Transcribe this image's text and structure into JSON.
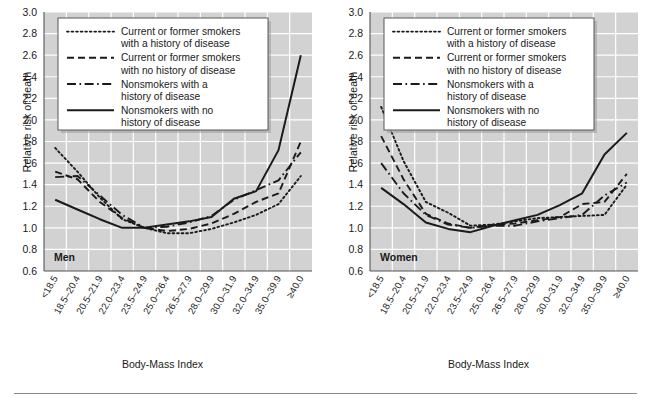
{
  "figure": {
    "bottom_rule": true,
    "background": "#ffffff",
    "plot_background": "#d2d2d2",
    "gridline_color": "#ffffff",
    "line_color": "#1a1a1a"
  },
  "panels": [
    {
      "id": "men",
      "group_label": "Men",
      "xlabel": "Body-Mass Index",
      "ylabel": "Relative risk of death"
    },
    {
      "id": "women",
      "group_label": "Women",
      "xlabel": "Body-Mass Index",
      "ylabel": "Relative risk of death"
    }
  ],
  "legend": {
    "entries": [
      {
        "style": "dotted",
        "line1": "Current or former smokers",
        "line2": "with a history of disease"
      },
      {
        "style": "dashed",
        "line1": "Current or former smokers",
        "line2": "with no history of disease"
      },
      {
        "style": "dashdot",
        "line1": "Nonsmokers with a",
        "line2": "history of disease"
      },
      {
        "style": "solid",
        "line1": "Nonsmokers with no",
        "line2": "history of disease"
      }
    ]
  },
  "chart_data": [
    {
      "type": "line",
      "title": "Men",
      "xlabel": "Body-Mass Index",
      "ylabel": "Relative risk of death",
      "ylim": [
        0.6,
        3.0
      ],
      "ytick_step": 0.2,
      "yticks": [
        "3.0",
        "2.8",
        "2.6",
        "2.4",
        "2.2",
        "2.0",
        "1.8",
        "1.6",
        "1.4",
        "1.2",
        "1.0",
        "0.8",
        "0.6"
      ],
      "grid": true,
      "legend_position": "upper-left-inside",
      "categories": [
        "<18.5",
        "18.5–20.4",
        "20.5–21.9",
        "22.0–23.4",
        "23.5–24.9",
        "25.0–26.4",
        "26.5–27.9",
        "28.0–29.9",
        "30.0–31.9",
        "32.0–34.9",
        "35.0–39.9",
        "≥40.0"
      ],
      "series": [
        {
          "name": "Current or former smokers with a history of disease",
          "style": "dotted",
          "values": [
            1.74,
            1.52,
            1.28,
            1.08,
            1.0,
            0.95,
            0.95,
            0.99,
            1.05,
            1.12,
            1.22,
            1.48
          ]
        },
        {
          "name": "Current or former smokers with no history of disease",
          "style": "dashed",
          "values": [
            1.52,
            1.45,
            1.24,
            1.09,
            1.0,
            0.97,
            0.99,
            1.04,
            1.13,
            1.24,
            1.32,
            1.8
          ]
        },
        {
          "name": "Nonsmokers with a history of disease",
          "style": "dashdot",
          "values": [
            1.47,
            1.48,
            1.3,
            1.12,
            1.0,
            1.01,
            1.05,
            1.11,
            1.26,
            1.35,
            1.44,
            1.7
          ]
        },
        {
          "name": "Nonsmokers with no history of disease",
          "style": "solid",
          "values": [
            1.26,
            1.17,
            1.08,
            1.0,
            1.0,
            1.03,
            1.06,
            1.1,
            1.27,
            1.34,
            1.72,
            2.6
          ]
        }
      ]
    },
    {
      "type": "line",
      "title": "Women",
      "xlabel": "Body-Mass Index",
      "ylabel": "Relative risk of death",
      "ylim": [
        0.6,
        3.0
      ],
      "ytick_step": 0.2,
      "yticks": [
        "3.0",
        "2.8",
        "2.6",
        "2.4",
        "2.2",
        "2.0",
        "1.8",
        "1.6",
        "1.4",
        "1.2",
        "1.0",
        "0.8",
        "0.6"
      ],
      "grid": true,
      "legend_position": "upper-left-inside",
      "categories": [
        "<18.5",
        "18.5–20.4",
        "20.5–21.9",
        "22.0–23.4",
        "23.5–24.9",
        "25.0–26.4",
        "26.5–27.9",
        "28.0–29.9",
        "30.0–31.9",
        "32.0–34.9",
        "35.0–39.9",
        "≥40.0"
      ],
      "series": [
        {
          "name": "Current or former smokers with a history of disease",
          "style": "dotted",
          "values": [
            2.12,
            1.62,
            1.24,
            1.14,
            1.02,
            1.03,
            1.06,
            1.09,
            1.1,
            1.11,
            1.12,
            1.4
          ]
        },
        {
          "name": "Current or former smokers with no history of disease",
          "style": "dashed",
          "values": [
            1.85,
            1.45,
            1.13,
            1.04,
            1.0,
            1.03,
            1.04,
            1.07,
            1.1,
            1.22,
            1.24,
            1.5
          ]
        },
        {
          "name": "Nonsmokers with a history of disease",
          "style": "dashdot",
          "values": [
            1.6,
            1.32,
            1.12,
            1.03,
            1.0,
            1.02,
            1.02,
            1.06,
            1.09,
            1.12,
            1.3,
            1.42
          ]
        },
        {
          "name": "Nonsmokers with no history of disease",
          "style": "solid",
          "values": [
            1.37,
            1.22,
            1.05,
            0.99,
            0.96,
            1.02,
            1.07,
            1.12,
            1.21,
            1.32,
            1.68,
            1.88
          ]
        }
      ]
    }
  ]
}
